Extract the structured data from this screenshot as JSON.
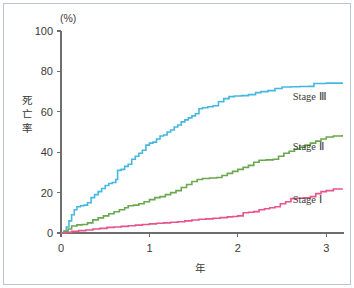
{
  "figure": {
    "unit_label": "(%)",
    "y_axis_title": "死亡率",
    "x_axis_title": "年",
    "border_color": "#b9c6d6",
    "axis_color": "#6d6d6d",
    "background": "#ffffff"
  },
  "axes": {
    "y_ticks": [
      "0",
      "20",
      "40",
      "60",
      "80",
      "100"
    ],
    "x_ticks": [
      "0",
      "1",
      "2",
      "3"
    ]
  },
  "legend": {
    "stage3_label": "Stage Ⅲ",
    "stage2_label": "Stage Ⅱ",
    "stage1_label": "Stage Ⅰ"
  },
  "chart_data": {
    "type": "line",
    "title": "",
    "subtitle": "",
    "xlabel": "年",
    "ylabel": "死亡率",
    "unit": "%",
    "xlim": [
      0,
      3.2
    ],
    "ylim": [
      0,
      100
    ],
    "x_ticks": [
      0,
      1,
      2,
      3
    ],
    "y_ticks": [
      0,
      20,
      40,
      60,
      80,
      100
    ],
    "grid": false,
    "legend_position": "inline-right",
    "step_curve": true,
    "annotations": [
      "Stage Ⅲ",
      "Stage Ⅱ",
      "Stage Ⅰ"
    ],
    "series": [
      {
        "name": "Stage Ⅲ",
        "color": "#45b8e0",
        "label": "Stage Ⅲ",
        "label_x": 2.62,
        "label_y": 66,
        "points": [
          [
            0.0,
            0.0
          ],
          [
            0.03,
            1.0
          ],
          [
            0.06,
            3.0
          ],
          [
            0.09,
            6.0
          ],
          [
            0.12,
            9.0
          ],
          [
            0.15,
            11.5
          ],
          [
            0.18,
            13.0
          ],
          [
            0.22,
            13.5
          ],
          [
            0.26,
            13.8
          ],
          [
            0.3,
            15.0
          ],
          [
            0.34,
            17.5
          ],
          [
            0.38,
            19.0
          ],
          [
            0.42,
            20.5
          ],
          [
            0.46,
            22.0
          ],
          [
            0.5,
            23.5
          ],
          [
            0.54,
            24.5
          ],
          [
            0.58,
            25.0
          ],
          [
            0.62,
            26.5
          ],
          [
            0.64,
            31.0
          ],
          [
            0.68,
            31.5
          ],
          [
            0.72,
            33.0
          ],
          [
            0.76,
            34.0
          ],
          [
            0.8,
            36.5
          ],
          [
            0.84,
            38.0
          ],
          [
            0.88,
            39.5
          ],
          [
            0.92,
            41.0
          ],
          [
            0.96,
            43.5
          ],
          [
            1.0,
            44.5
          ],
          [
            1.04,
            45.0
          ],
          [
            1.08,
            46.5
          ],
          [
            1.12,
            48.0
          ],
          [
            1.16,
            48.5
          ],
          [
            1.2,
            50.0
          ],
          [
            1.24,
            51.0
          ],
          [
            1.28,
            52.5
          ],
          [
            1.32,
            53.5
          ],
          [
            1.36,
            55.0
          ],
          [
            1.4,
            56.0
          ],
          [
            1.44,
            57.0
          ],
          [
            1.48,
            58.0
          ],
          [
            1.52,
            59.0
          ],
          [
            1.56,
            61.5
          ],
          [
            1.6,
            62.0
          ],
          [
            1.66,
            62.5
          ],
          [
            1.72,
            63.0
          ],
          [
            1.78,
            65.0
          ],
          [
            1.84,
            66.5
          ],
          [
            1.9,
            67.5
          ],
          [
            1.96,
            67.8
          ],
          [
            2.04,
            68.0
          ],
          [
            2.12,
            68.5
          ],
          [
            2.2,
            69.5
          ],
          [
            2.26,
            70.0
          ],
          [
            2.34,
            70.5
          ],
          [
            2.42,
            71.5
          ],
          [
            2.5,
            72.3
          ],
          [
            2.6,
            72.4
          ],
          [
            2.7,
            72.5
          ],
          [
            2.8,
            72.6
          ],
          [
            2.86,
            74.0
          ],
          [
            3.0,
            74.2
          ],
          [
            3.18,
            74.5
          ]
        ]
      },
      {
        "name": "Stage Ⅱ",
        "color": "#6aa84f",
        "label": "Stage Ⅱ",
        "label_x": 2.62,
        "label_y": 41,
        "points": [
          [
            0.0,
            0.0
          ],
          [
            0.04,
            0.8
          ],
          [
            0.08,
            2.0
          ],
          [
            0.12,
            3.5
          ],
          [
            0.18,
            4.0
          ],
          [
            0.24,
            4.2
          ],
          [
            0.3,
            5.0
          ],
          [
            0.36,
            6.5
          ],
          [
            0.42,
            7.5
          ],
          [
            0.48,
            8.5
          ],
          [
            0.54,
            9.5
          ],
          [
            0.6,
            10.5
          ],
          [
            0.66,
            11.5
          ],
          [
            0.72,
            12.5
          ],
          [
            0.76,
            13.5
          ],
          [
            0.82,
            13.8
          ],
          [
            0.88,
            14.5
          ],
          [
            0.94,
            15.5
          ],
          [
            1.0,
            16.5
          ],
          [
            1.06,
            17.5
          ],
          [
            1.12,
            18.0
          ],
          [
            1.18,
            19.0
          ],
          [
            1.24,
            20.0
          ],
          [
            1.3,
            21.0
          ],
          [
            1.36,
            22.5
          ],
          [
            1.42,
            24.0
          ],
          [
            1.48,
            25.5
          ],
          [
            1.54,
            26.5
          ],
          [
            1.6,
            27.0
          ],
          [
            1.68,
            27.2
          ],
          [
            1.76,
            27.5
          ],
          [
            1.82,
            28.5
          ],
          [
            1.88,
            29.5
          ],
          [
            1.94,
            30.5
          ],
          [
            2.0,
            31.5
          ],
          [
            2.06,
            32.5
          ],
          [
            2.12,
            33.5
          ],
          [
            2.18,
            35.0
          ],
          [
            2.24,
            36.0
          ],
          [
            2.32,
            36.2
          ],
          [
            2.4,
            36.5
          ],
          [
            2.46,
            38.0
          ],
          [
            2.52,
            39.5
          ],
          [
            2.58,
            40.5
          ],
          [
            2.64,
            41.5
          ],
          [
            2.7,
            42.5
          ],
          [
            2.76,
            43.5
          ],
          [
            2.82,
            44.5
          ],
          [
            2.88,
            45.5
          ],
          [
            2.94,
            46.5
          ],
          [
            3.0,
            47.5
          ],
          [
            3.08,
            48.0
          ],
          [
            3.18,
            48.5
          ]
        ]
      },
      {
        "name": "Stage Ⅰ",
        "color": "#e8548a",
        "label": "Stage Ⅰ",
        "label_x": 2.62,
        "label_y": 15,
        "points": [
          [
            0.0,
            0.0
          ],
          [
            0.06,
            0.3
          ],
          [
            0.12,
            0.8
          ],
          [
            0.2,
            1.2
          ],
          [
            0.28,
            1.5
          ],
          [
            0.36,
            2.0
          ],
          [
            0.44,
            2.3
          ],
          [
            0.52,
            2.8
          ],
          [
            0.6,
            3.0
          ],
          [
            0.68,
            3.3
          ],
          [
            0.76,
            3.6
          ],
          [
            0.84,
            3.9
          ],
          [
            0.92,
            4.2
          ],
          [
            1.0,
            4.5
          ],
          [
            1.08,
            4.8
          ],
          [
            1.16,
            5.0
          ],
          [
            1.24,
            5.3
          ],
          [
            1.32,
            5.6
          ],
          [
            1.4,
            6.0
          ],
          [
            1.48,
            6.4
          ],
          [
            1.56,
            6.8
          ],
          [
            1.64,
            7.0
          ],
          [
            1.72,
            7.3
          ],
          [
            1.8,
            7.6
          ],
          [
            1.88,
            8.0
          ],
          [
            1.94,
            8.2
          ],
          [
            2.0,
            8.5
          ],
          [
            2.06,
            10.0
          ],
          [
            2.12,
            10.3
          ],
          [
            2.18,
            10.6
          ],
          [
            2.24,
            11.5
          ],
          [
            2.3,
            12.0
          ],
          [
            2.36,
            12.5
          ],
          [
            2.42,
            13.0
          ],
          [
            2.48,
            14.5
          ],
          [
            2.54,
            15.5
          ],
          [
            2.6,
            17.0
          ],
          [
            2.66,
            17.2
          ],
          [
            2.74,
            17.4
          ],
          [
            2.82,
            18.0
          ],
          [
            2.88,
            19.5
          ],
          [
            2.94,
            20.5
          ],
          [
            3.0,
            21.0
          ],
          [
            3.08,
            21.8
          ],
          [
            3.18,
            22.0
          ]
        ]
      }
    ]
  }
}
